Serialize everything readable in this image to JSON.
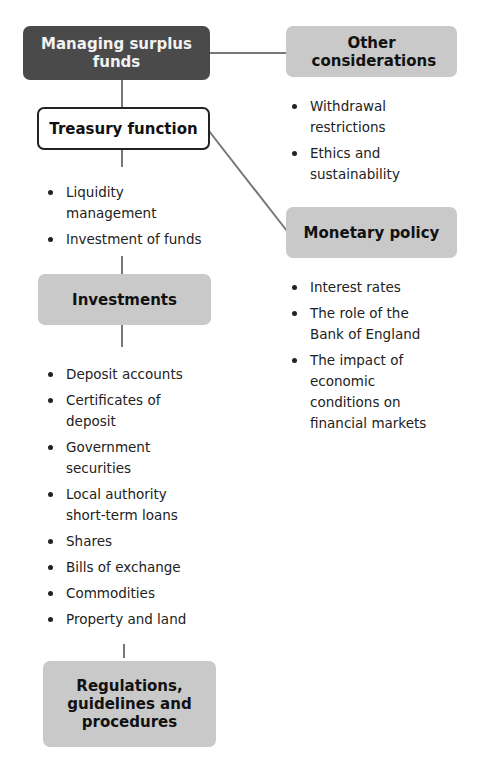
{
  "diagram": {
    "root": {
      "label": "Managing surplus funds"
    },
    "treasury": {
      "label": "Treasury function",
      "items": [
        "Liquidity management",
        "Investment of funds"
      ]
    },
    "investments": {
      "label": "Investments",
      "items": [
        "Deposit accounts",
        "Certificates of deposit",
        "Government securities",
        "Local authority short-term loans",
        "Shares",
        "Bills of exchange",
        "Commodities",
        "Property and land"
      ]
    },
    "regulations": {
      "label": "Regulations, guidelines and procedures"
    },
    "other": {
      "label": "Other considerations",
      "items": [
        "Withdrawal restrictions",
        "Ethics and sustainability"
      ]
    },
    "monetary": {
      "label": "Monetary policy",
      "items": [
        "Interest rates",
        "The role of the Bank of England",
        "The impact of economic conditions on financial markets"
      ]
    },
    "colors": {
      "root_fill": "#4a4a4a",
      "grey_fill": "#c9c9c9",
      "connector": "#777777"
    }
  }
}
